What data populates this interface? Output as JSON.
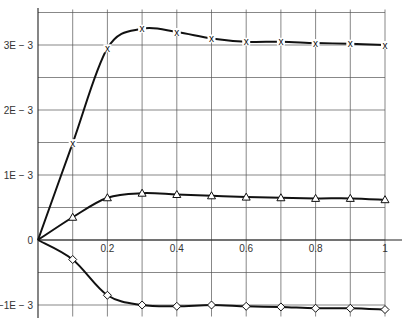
{
  "chart_data": {
    "type": "line",
    "title": "",
    "xlabel": "",
    "ylabel": "",
    "xlim": [
      0,
      1
    ],
    "ylim": [
      -0.0011,
      0.0035
    ],
    "grid": true,
    "legend": null,
    "x_ticks": [
      {
        "value": 0.2,
        "label": "0.2"
      },
      {
        "value": 0.4,
        "label": "0.4"
      },
      {
        "value": 0.6,
        "label": "0.6"
      },
      {
        "value": 0.8,
        "label": "0.8"
      },
      {
        "value": 1.0,
        "label": "1"
      }
    ],
    "y_ticks": [
      {
        "value": 0.003,
        "label": "3E − 3"
      },
      {
        "value": 0.002,
        "label": "2E − 3"
      },
      {
        "value": 0.001,
        "label": "1E − 3"
      },
      {
        "value": 0,
        "label": "0"
      },
      {
        "value": -0.001,
        "label": "−1E − 3"
      }
    ],
    "x": [
      0,
      0.1,
      0.2,
      0.3,
      0.4,
      0.5,
      0.6,
      0.7,
      0.8,
      0.9,
      1.0
    ],
    "series": [
      {
        "name": "x-marker series",
        "marker": "x",
        "values": [
          0,
          0.00149,
          0.00295,
          0.00325,
          0.0032,
          0.0031,
          0.00305,
          0.00305,
          0.00303,
          0.00302,
          0.003
        ]
      },
      {
        "name": "triangle series",
        "marker": "triangle",
        "values": [
          0,
          0.00035,
          0.00065,
          0.00072,
          0.0007,
          0.00068,
          0.00066,
          0.00065,
          0.00064,
          0.00064,
          0.00062
        ]
      },
      {
        "name": "diamond series",
        "marker": "diamond",
        "values": [
          0,
          -0.0003,
          -0.00085,
          -0.001,
          -0.00102,
          -0.001,
          -0.00102,
          -0.00103,
          -0.00105,
          -0.00105,
          -0.00107
        ]
      }
    ]
  },
  "colors": {
    "line": "#111111",
    "grid": "#555555",
    "text": "#333333"
  }
}
